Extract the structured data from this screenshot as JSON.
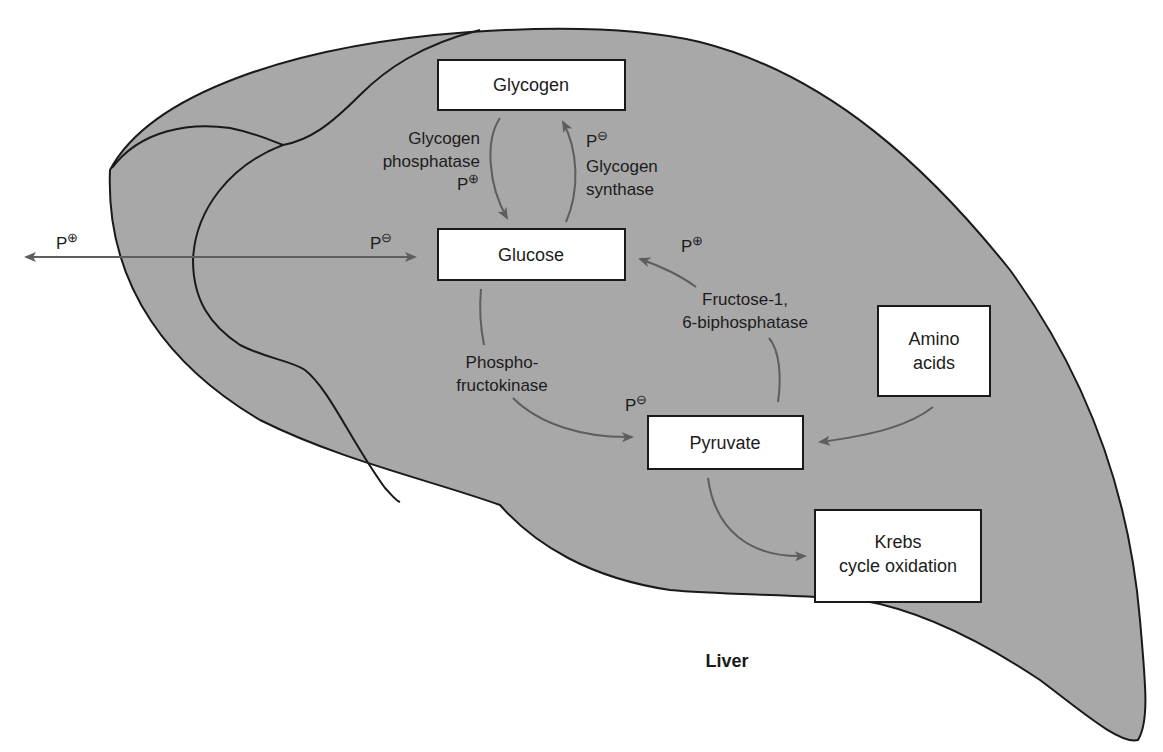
{
  "diagram": {
    "organ_label": "Liver",
    "colors": {
      "organ_fill": "#a8a8a8",
      "outline": "#1a1a1a",
      "box_fill": "#ffffff",
      "arrow": "#5e5e5e",
      "text": "#1c1c1c",
      "background": "#ffffff"
    },
    "boxes": {
      "glycogen": {
        "label": "Glycogen"
      },
      "glucose": {
        "label": "Glucose"
      },
      "pyruvate": {
        "label": "Pyruvate"
      },
      "amino_acids": {
        "line1": "Amino",
        "line2": "acids"
      },
      "krebs": {
        "line1": "Krebs",
        "line2": "cycle oxidation"
      }
    },
    "enzymes": {
      "glycogen_phosphatase": {
        "line1": "Glycogen",
        "line2": "phosphatase",
        "regulation": "P",
        "sign": "⊕"
      },
      "glycogen_synthase": {
        "line1": "Glycogen",
        "line2": "synthase",
        "regulation": "P",
        "sign": "⊖"
      },
      "phosphofructokinase": {
        "line1": "Phospho-",
        "line2": "fructokinase",
        "regulation": "P",
        "sign": "⊖"
      },
      "fructose_biphosphatase": {
        "line1": "Fructose-1,",
        "line2": "6-biphosphatase",
        "regulation": "P",
        "sign": "⊕"
      }
    },
    "transport": {
      "export": {
        "regulation": "P",
        "sign": "⊕"
      },
      "import": {
        "regulation": "P",
        "sign": "⊖"
      }
    }
  }
}
